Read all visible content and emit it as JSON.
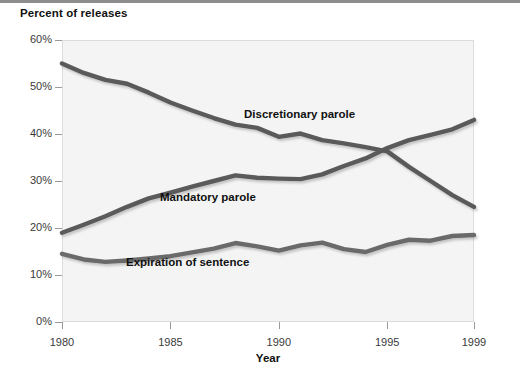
{
  "chart_data": {
    "type": "line",
    "title": "",
    "ylabel": "Percent of releases",
    "xlabel": "Year",
    "ylim": [
      0,
      60
    ],
    "xlim": [
      1980,
      1999
    ],
    "grid": false,
    "legend_position": "inline-annotations",
    "y_ticks": [
      "0%",
      "10%",
      "20%",
      "30%",
      "40%",
      "50%",
      "60%"
    ],
    "y_tick_values": [
      0,
      10,
      20,
      30,
      40,
      50,
      60
    ],
    "x_ticks": [
      "1980",
      "1985",
      "1990",
      "1995",
      "1999"
    ],
    "x_tick_values": [
      1980,
      1985,
      1990,
      1995,
      1999
    ],
    "x": [
      1980,
      1981,
      1982,
      1983,
      1984,
      1985,
      1986,
      1987,
      1988,
      1989,
      1990,
      1991,
      1992,
      1993,
      1994,
      1995,
      1996,
      1997,
      1998,
      1999
    ],
    "series": [
      {
        "name": "Discretionary parole",
        "color": "#5a5a5a",
        "values": [
          55.0,
          53.0,
          51.5,
          50.7,
          48.8,
          46.7,
          45.0,
          43.4,
          42.0,
          41.3,
          39.4,
          40.1,
          38.7,
          38.0,
          37.2,
          36.3,
          33.0,
          30.0,
          27.0,
          24.5
        ]
      },
      {
        "name": "Mandatory parole",
        "color": "#5a5a5a",
        "values": [
          19.0,
          20.7,
          22.5,
          24.5,
          26.3,
          27.5,
          28.8,
          30.0,
          31.2,
          30.7,
          30.5,
          30.4,
          31.4,
          33.2,
          34.8,
          37.0,
          38.7,
          39.8,
          41.0,
          43.0
        ]
      },
      {
        "name": "Expiration of sentence",
        "color": "#6a6a6a",
        "values": [
          14.5,
          13.3,
          12.8,
          13.1,
          13.5,
          14.0,
          14.8,
          15.6,
          16.8,
          16.1,
          15.2,
          16.3,
          16.9,
          15.5,
          14.9,
          16.4,
          17.5,
          17.3,
          18.3,
          18.5
        ]
      }
    ]
  },
  "labels": {
    "series_discretionary": "Discretionary parole",
    "series_mandatory": "Mandatory parole",
    "series_expiration": "Expiration of sentence"
  },
  "axis": {
    "y_title": "Percent of releases",
    "x_title": "Year"
  }
}
